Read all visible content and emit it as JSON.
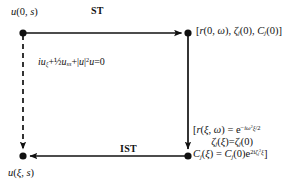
{
  "figure": {
    "type": "commutative-diagram",
    "background_color": "#ffffff",
    "ink_color": "#111111",
    "nodes": {
      "top_left": {
        "label": "u(0, s)",
        "x": 23,
        "y": 33
      },
      "top_right": {
        "label": "[r(0, ω), ζⱼ(0), Cⱼ(0)]",
        "x": 188,
        "y": 33
      },
      "bottom_left": {
        "label": "u(ξ, s)",
        "x": 23,
        "y": 156
      },
      "bottom_right": {
        "label_lines": [
          "[r(ξ, ω) = e−iω²ξ/2",
          "ζⱼ(ξ)=ζⱼ(0)",
          "Cⱼ(ξ) = Cⱼ(0)e2iζⱼ²ξ]"
        ],
        "x": 188,
        "y": 156
      }
    },
    "edges": {
      "top": {
        "label": "ST",
        "direction": "right",
        "style": "solid"
      },
      "right": {
        "label": "",
        "direction": "down",
        "style": "solid"
      },
      "bottom": {
        "label": "IST",
        "direction": "left",
        "style": "solid"
      },
      "left": {
        "label": "iuξ+½u_ss+|u|²u=0",
        "direction": "down",
        "style": "dashed"
      }
    }
  },
  "labels": {
    "top_left_node": {
      "u": "u",
      "args": "(0, ",
      "s": "s",
      "close": ")"
    },
    "top_arrow": "ST",
    "bottom_arrow": "IST",
    "bottom_left_node": {
      "u": "u",
      "open": "(",
      "xi": "ξ",
      "comma": ", ",
      "s": "s",
      "close": ")"
    },
    "top_right_node": {
      "open": "[",
      "r": "r",
      "r_args_open": "(0, ",
      "omega": "ω",
      "r_args_close": "), ",
      "zeta": "ζ",
      "zeta_sub": "j",
      "zeta_args": "(0), ",
      "C": "C",
      "C_sub": "j",
      "C_args": "(0)",
      "close": "]"
    },
    "nls_equation": {
      "i": "i",
      "u1": "u",
      "sub_xi": "ξ",
      "plus1": "+",
      "half": "½",
      "u2": "u",
      "sub_ss": "ss",
      "plus2": "+|",
      "u3": "u",
      "bar_sq": "|",
      "sup_two": "2",
      "u4": "u",
      "eq_zero": "=0"
    },
    "bottom_right_node": {
      "line1": {
        "open": "[",
        "r": "r",
        "open_paren": "(",
        "xi": "ξ",
        "comma": ", ",
        "omega": "ω",
        "close_paren": ") = ",
        "e": "e",
        "exp_minus": "−",
        "exp_i": "i",
        "exp_omega": "ω",
        "exp_two": "2",
        "exp_xi": "ξ",
        "exp_over": "/2"
      },
      "line2": {
        "zeta1": "ζ",
        "sub1": "j",
        "open1": "(",
        "xi": "ξ",
        "close1": ")=",
        "zeta2": "ζ",
        "sub2": "j",
        "zero": "(0)"
      },
      "line3": {
        "C1": "C",
        "sub1": "j",
        "open1": "(",
        "xi": "ξ",
        "close1": ") = ",
        "C2": "C",
        "sub2": "j",
        "zero": "(0)",
        "e": "e",
        "exp_two_i": "2i",
        "exp_zeta": "ζ",
        "exp_sub_j": "j",
        "exp_sq": "2",
        "exp_xi": "ξ",
        "close_bracket": "]"
      }
    }
  }
}
